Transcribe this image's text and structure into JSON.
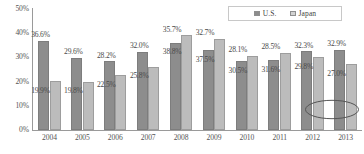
{
  "legend": {
    "entries": [
      {
        "label": "U.S.",
        "color": "#8d8d8d",
        "icon": "legend-swatch-square"
      },
      {
        "label": "Japan",
        "color": "#bcbcbc",
        "icon": "legend-swatch-square"
      }
    ]
  },
  "axes": {
    "y_ticks": [
      "50%",
      "40%",
      "30%",
      "20%",
      "10%",
      "0%"
    ],
    "x_ticks": [
      "2004",
      "2005",
      "2006",
      "2007",
      "2008",
      "2009",
      "2010",
      "2011",
      "2012",
      "2013"
    ]
  },
  "annotation": {
    "highlighted_value": "27.0%",
    "shape": "ellipse-outline"
  },
  "chart_data": {
    "type": "bar",
    "title": "",
    "subtitle": "",
    "xlabel": "",
    "ylabel": "",
    "ylim": [
      0,
      50
    ],
    "ytick_step": 10,
    "ytick_format": "percent",
    "grid": false,
    "legend_position": "top-right",
    "categories": [
      "2004",
      "2005",
      "2006",
      "2007",
      "2008",
      "2009",
      "2010",
      "2011",
      "2012",
      "2013"
    ],
    "series": [
      {
        "name": "U.S.",
        "color": "#8d8d8d",
        "values": [
          36.6,
          29.6,
          28.2,
          32.0,
          35.7,
          32.7,
          28.1,
          28.5,
          32.3,
          32.9
        ],
        "labels": [
          "36.6%",
          "29.6%",
          "28.2%",
          "32.0%",
          "35.7%",
          "32.7%",
          "28.1%",
          "28.5%",
          "32.3%",
          "32.9%"
        ]
      },
      {
        "name": "Japan",
        "color": "#bcbcbc",
        "values": [
          19.9,
          19.8,
          22.5,
          25.8,
          38.8,
          37.5,
          30.5,
          31.6,
          29.8,
          27.0
        ],
        "labels": [
          "19.9%",
          "19.8%",
          "22.5%",
          "25.8%",
          "38.8%",
          "37.5%",
          "30.5%",
          "31.6%",
          "29.8%",
          "27.0%"
        ]
      }
    ],
    "annotations": [
      {
        "text": "27.0%",
        "series": "Japan",
        "category": "2013",
        "style": "circled"
      }
    ]
  }
}
